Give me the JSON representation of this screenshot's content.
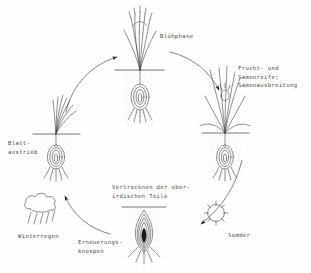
{
  "diagram": {
    "type": "life-cycle",
    "direction": "clockwise",
    "background_color": "#fefefe",
    "ink_color": "#4a4a4a",
    "stages": [
      {
        "id": "bluehphase",
        "label": "Blühphase",
        "position": "top",
        "icon": "flowering-plant"
      },
      {
        "id": "fruchtreife",
        "label": "Frucht- und\nSamenreife;\nSamenausbreitung",
        "position": "right",
        "icon": "fruiting-plant"
      },
      {
        "id": "vertrocknen",
        "label": "Vertrocknen der ober-\nirdischen Teile",
        "position": "bottom-center",
        "icon": "dormant-bulb"
      },
      {
        "id": "erneuerungsknospen",
        "label": "Erneuerungs-\nknospen",
        "position": "bottom",
        "icon": "renewal-bud"
      },
      {
        "id": "blattaustrieb",
        "label": "Blatt-\naustrieb",
        "position": "left",
        "icon": "leafing-plant"
      }
    ],
    "season_markers": [
      {
        "id": "sommer",
        "label": "Sommer",
        "icon": "sun-icon",
        "position": "bottom-right"
      },
      {
        "id": "winterregen",
        "label": "Winterregen",
        "icon": "rain-cloud-icon",
        "position": "bottom-left"
      }
    ],
    "arrows": [
      {
        "id": "arrow-to-bluehphase",
        "from": "blattaustrieb",
        "to": "bluehphase"
      },
      {
        "id": "arrow-to-fruchtreife",
        "from": "bluehphase",
        "to": "fruchtreife"
      },
      {
        "id": "arrow-to-vertrocknen",
        "from": "fruchtreife",
        "to": "vertrocknen"
      },
      {
        "id": "arrow-to-blattaustrieb",
        "from": "vertrocknen",
        "to": "blattaustrieb"
      }
    ]
  }
}
